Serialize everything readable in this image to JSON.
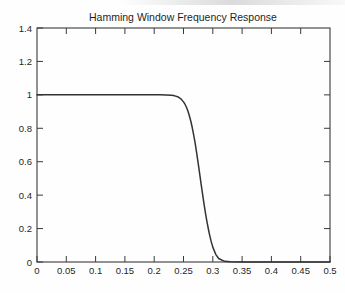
{
  "chart_data": {
    "type": "line",
    "title": "Hamming Window Frequency Response",
    "xlabel": "",
    "ylabel": "",
    "xlim": [
      0,
      0.5
    ],
    "ylim": [
      0,
      1.4
    ],
    "grid": false,
    "legend": null,
    "box": true,
    "tick_direction": "in",
    "line_color": "#333333",
    "background_color": "#ffffff",
    "xticks": [
      0,
      0.05,
      0.1,
      0.15,
      0.2,
      0.25,
      0.3,
      0.35,
      0.4,
      0.45,
      0.5
    ],
    "xticklabels": [
      "0",
      "0.05",
      "0.1",
      "0.15",
      "0.2",
      "0.25",
      "0.3",
      "0.35",
      "0.4",
      "0.45",
      "0.5"
    ],
    "yticks": [
      0,
      0.2,
      0.4,
      0.6,
      0.8,
      1,
      1.2,
      1.4
    ],
    "yticklabels": [
      "0",
      "0.2",
      "0.4",
      "0.6",
      "0.8",
      "1",
      "1.2",
      "1.4"
    ],
    "series": [
      {
        "name": "Hamming window lowpass magnitude response",
        "x": [
          0,
          0.01,
          0.02,
          0.03,
          0.04,
          0.05,
          0.06,
          0.07,
          0.08,
          0.09,
          0.1,
          0.11,
          0.12,
          0.13,
          0.14,
          0.15,
          0.16,
          0.17,
          0.18,
          0.19,
          0.2,
          0.21,
          0.22,
          0.23,
          0.235,
          0.24,
          0.245,
          0.25,
          0.2525,
          0.255,
          0.2575,
          0.26,
          0.2625,
          0.265,
          0.2675,
          0.27,
          0.2725,
          0.275,
          0.2775,
          0.28,
          0.2825,
          0.285,
          0.2875,
          0.29,
          0.2925,
          0.295,
          0.2975,
          0.3,
          0.305,
          0.31,
          0.32,
          0.33,
          0.35,
          0.37,
          0.4,
          0.43,
          0.45,
          0.47,
          0.5
        ],
        "y": [
          1.0,
          1.0,
          1.0,
          1.0,
          1.0,
          1.0,
          1.0,
          1.0,
          1.0,
          1.0,
          1.0,
          1.0,
          1.0,
          1.0,
          1.0,
          1.0,
          1.0,
          1.0,
          1.0,
          1.0,
          1.0,
          1.0,
          0.999,
          0.997,
          0.994,
          0.989,
          0.978,
          0.958,
          0.944,
          0.926,
          0.903,
          0.875,
          0.842,
          0.803,
          0.758,
          0.708,
          0.652,
          0.592,
          0.53,
          0.468,
          0.407,
          0.348,
          0.293,
          0.242,
          0.196,
          0.155,
          0.119,
          0.089,
          0.046,
          0.021,
          0.004,
          0.001,
          0.0,
          0.0,
          0.0,
          0.0,
          0.0,
          0.0,
          0.0
        ]
      }
    ],
    "annotations": {
      "passband_value": "1",
      "cutoff_frequency": "0.272",
      "transition_start": "0.25",
      "transition_end": "0.30"
    }
  }
}
